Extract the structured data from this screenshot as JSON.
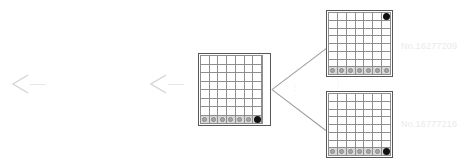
{
  "diagram": {
    "type": "search-tree-expansion",
    "title_text": "",
    "arrows": [
      {
        "name": "arrow-left-outer",
        "glyph": "⟨",
        "trail_label": ""
      },
      {
        "name": "arrow-left-inner",
        "glyph": "⟨",
        "trail_label": ""
      }
    ],
    "boards": [
      {
        "id": "parent-board",
        "label": "",
        "columns": 7,
        "rows": 8,
        "shaded_row_index": 7,
        "has_right_margin_strip": true,
        "stones": [
          {
            "row": 7,
            "col": 0,
            "color": "gray"
          },
          {
            "row": 7,
            "col": 1,
            "color": "gray"
          },
          {
            "row": 7,
            "col": 2,
            "color": "gray"
          },
          {
            "row": 7,
            "col": 3,
            "color": "gray"
          },
          {
            "row": 7,
            "col": 4,
            "color": "gray"
          },
          {
            "row": 7,
            "col": 5,
            "color": "gray"
          },
          {
            "row": 7,
            "col": 6,
            "color": "black"
          }
        ]
      },
      {
        "id": "child-board-top",
        "label": "No.16277209",
        "columns": 7,
        "rows": 8,
        "shaded_row_index": 7,
        "has_right_margin_strip": false,
        "stones": [
          {
            "row": 0,
            "col": 6,
            "color": "black"
          },
          {
            "row": 7,
            "col": 0,
            "color": "gray"
          },
          {
            "row": 7,
            "col": 1,
            "color": "gray"
          },
          {
            "row": 7,
            "col": 2,
            "color": "gray"
          },
          {
            "row": 7,
            "col": 3,
            "color": "gray"
          },
          {
            "row": 7,
            "col": 4,
            "color": "gray"
          },
          {
            "row": 7,
            "col": 5,
            "color": "gray"
          },
          {
            "row": 7,
            "col": 6,
            "color": "gray"
          }
        ]
      },
      {
        "id": "child-board-bottom",
        "label": "No.16777216",
        "columns": 7,
        "rows": 8,
        "shaded_row_index": 7,
        "has_right_margin_strip": false,
        "stones": [
          {
            "row": 7,
            "col": 0,
            "color": "gray"
          },
          {
            "row": 7,
            "col": 1,
            "color": "gray"
          },
          {
            "row": 7,
            "col": 2,
            "color": "gray"
          },
          {
            "row": 7,
            "col": 3,
            "color": "gray"
          },
          {
            "row": 7,
            "col": 4,
            "color": "gray"
          },
          {
            "row": 7,
            "col": 5,
            "color": "gray"
          },
          {
            "row": 7,
            "col": 6,
            "color": "black"
          }
        ]
      }
    ],
    "labels": {
      "child_top": "No.16277209",
      "child_bottom": "No.16777216"
    },
    "ellipsis_marker": "⋮",
    "colors": {
      "board_border": "#585858",
      "grid_line": "#8e8e8e",
      "shaded_cell": "#d8d8d8",
      "gray_stone": "#a8a8a8",
      "black_stone": "#111111",
      "connector": "#9a9a9a",
      "label_text": "#eaeaea",
      "arrow": "#d2d2d2",
      "background": "#ffffff"
    }
  }
}
